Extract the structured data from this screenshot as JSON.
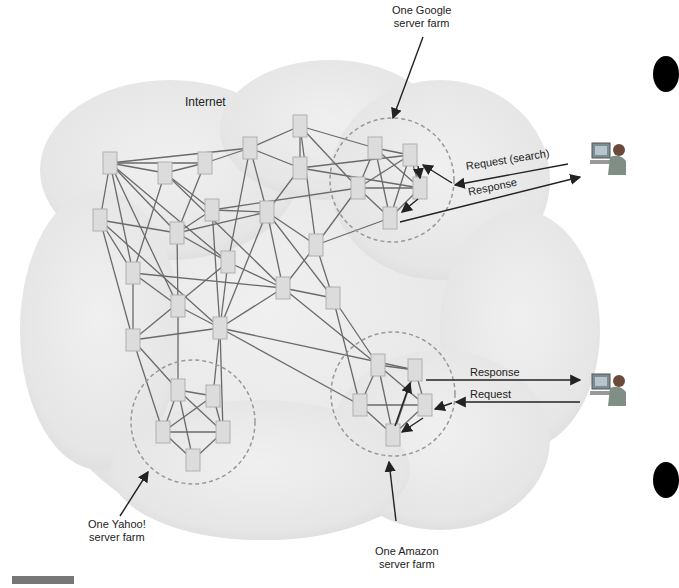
{
  "diagram": {
    "title_region": "Internet",
    "labels": {
      "google": [
        "One Google",
        "server farm"
      ],
      "yahoo": [
        "One Yahoo!",
        "server farm"
      ],
      "amazon": [
        "One Amazon",
        "server farm"
      ],
      "request_search": "Request (search)",
      "response_top": "Response",
      "response_bottom": "Response",
      "request_bottom": "Request"
    },
    "colors": {
      "cloud": "#ececec",
      "node_fill": "#dcdcdc",
      "node_stroke": "#b0b0b0",
      "link": "#6a6a6a",
      "farm_circle": "#999999",
      "arrow": "#222222"
    },
    "nodes": [
      [
        110,
        163
      ],
      [
        165,
        173
      ],
      [
        205,
        163
      ],
      [
        250,
        148
      ],
      [
        300,
        126
      ],
      [
        300,
        168
      ],
      [
        100,
        220
      ],
      [
        177,
        233
      ],
      [
        212,
        210
      ],
      [
        267,
        212
      ],
      [
        375,
        148
      ],
      [
        410,
        155
      ],
      [
        358,
        188
      ],
      [
        420,
        188
      ],
      [
        390,
        218
      ],
      [
        316,
        245
      ],
      [
        228,
        262
      ],
      [
        133,
        273
      ],
      [
        283,
        288
      ],
      [
        178,
        306
      ],
      [
        333,
        298
      ],
      [
        133,
        340
      ],
      [
        220,
        328
      ],
      [
        378,
        365
      ],
      [
        415,
        370
      ],
      [
        360,
        405
      ],
      [
        425,
        405
      ],
      [
        393,
        435
      ],
      [
        178,
        390
      ],
      [
        213,
        396
      ],
      [
        163,
        432
      ],
      [
        223,
        432
      ],
      [
        193,
        460
      ]
    ],
    "users": [
      "user-top",
      "user-bottom"
    ]
  }
}
